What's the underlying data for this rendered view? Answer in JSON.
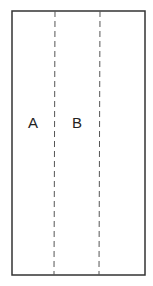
{
  "diagram": {
    "outline": {
      "x": 12,
      "y": 11,
      "width": 133,
      "height": 264,
      "stroke": "#333333"
    },
    "fold_lines": [
      {
        "x": 55,
        "style": "dashed",
        "stroke": "#555555"
      },
      {
        "x": 100,
        "style": "dashed",
        "stroke": "#555555"
      }
    ],
    "labels": [
      {
        "text": "A",
        "x": 33,
        "y": 127
      },
      {
        "text": "B",
        "x": 77,
        "y": 127
      }
    ]
  }
}
